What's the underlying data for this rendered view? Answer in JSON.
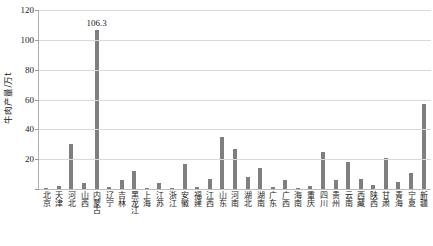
{
  "chart_data": {
    "type": "bar",
    "title": "",
    "xlabel": "",
    "ylabel": "牛肉产量/万t",
    "ylim": [
      0,
      120
    ],
    "ytick_step": 20,
    "yticks": [
      120,
      100,
      80,
      60,
      40,
      20,
      0
    ],
    "ytick_labels": [
      "120",
      "100",
      "80",
      "60",
      "40",
      "20",
      "0"
    ],
    "grid": true,
    "legend": "none",
    "bar_color": "#7f7f7f",
    "annotations": [
      {
        "category": "内蒙古",
        "text": "106.3"
      }
    ],
    "categories": [
      "北京",
      "天津",
      "河北",
      "山西",
      "内蒙古",
      "辽宁",
      "吉林",
      "黑龙江",
      "上海",
      "江苏",
      "浙江",
      "安徽",
      "福建",
      "江西",
      "山东",
      "河南",
      "湖北",
      "湖南",
      "广东",
      "广西",
      "海南",
      "重庆",
      "四川",
      "贵州",
      "云南",
      "西藏",
      "陕西",
      "甘肃",
      "青海",
      "宁夏",
      "新疆"
    ],
    "values": [
      1.0,
      2.0,
      30.0,
      4.0,
      106.3,
      1.5,
      6.0,
      12.0,
      0.5,
      4.0,
      1.0,
      17.0,
      1.5,
      7.0,
      35.0,
      26.5,
      8.0,
      14.0,
      1.5,
      6.0,
      1.0,
      2.0,
      25.0,
      6.0,
      18.0,
      7.0,
      3.0,
      21.0,
      5.0,
      11.0,
      57.0
    ]
  }
}
